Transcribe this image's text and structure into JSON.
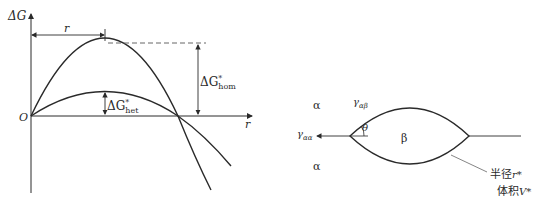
{
  "left_diagram": {
    "y_axis_label": "ΔG",
    "x_axis_label": "r",
    "origin_label": "O",
    "radius_marker_label": "r",
    "hom_barrier_label": "ΔG",
    "hom_barrier_sup": "*",
    "hom_barrier_sub": "hom",
    "het_barrier_label": "ΔG",
    "het_barrier_sup": "*",
    "het_barrier_sub": "het",
    "curves": [
      "homogeneous",
      "heterogeneous"
    ]
  },
  "right_diagram": {
    "phase_alpha_top": "α",
    "phase_alpha_bottom": "α",
    "phase_beta": "β",
    "gamma_alpha_beta": "γ",
    "gamma_alpha_beta_sub": "αβ",
    "gamma_alpha_alpha": "γ",
    "gamma_alpha_alpha_sub": "αα",
    "angle_label": "θ",
    "radius_label_cn": "半径",
    "radius_symbol": "r*",
    "volume_label_cn": "体积",
    "volume_symbol": "V*"
  },
  "colors": {
    "stroke": "#2a2a2a",
    "dashed": "#555555",
    "leader": "#777777"
  }
}
